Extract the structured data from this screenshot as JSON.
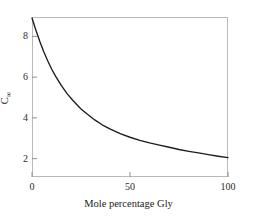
{
  "figure": {
    "background_color": "#ffffff",
    "frame_color": "#b9b9b9",
    "curve_color": "#1c1c1c",
    "tick_color": "#8f8f8f"
  },
  "axes": {
    "y_title_base": "C",
    "y_title_sub": "∞",
    "x_title": "Mole percentage Gly",
    "y_ticks": [
      "2",
      "4",
      "6",
      "8"
    ],
    "x_ticks": [
      "0",
      "50",
      "100"
    ]
  },
  "chart_data": {
    "type": "line",
    "title": "",
    "subtitle": "",
    "xlabel": "Mole percentage Gly",
    "ylabel": "C∞",
    "xlim": [
      0,
      100
    ],
    "ylim": [
      1.1,
      8.95
    ],
    "xticks": [
      0,
      50,
      100
    ],
    "yticks": [
      2,
      4,
      6,
      8
    ],
    "grid": false,
    "legend": null,
    "series": [
      {
        "name": "C-infinity vs mole percentage Gly",
        "color": "#1c1c1c",
        "x": [
          0,
          2,
          4,
          6,
          8,
          10,
          12,
          15,
          18,
          21,
          25,
          28,
          32,
          36,
          40,
          45,
          50,
          55,
          60,
          65,
          70,
          75,
          80,
          85,
          90,
          95,
          100
        ],
        "y": [
          8.9,
          8.3,
          7.75,
          7.25,
          6.8,
          6.4,
          6.05,
          5.58,
          5.18,
          4.84,
          4.44,
          4.2,
          3.9,
          3.65,
          3.45,
          3.23,
          3.05,
          2.9,
          2.77,
          2.66,
          2.56,
          2.45,
          2.36,
          2.28,
          2.2,
          2.12,
          2.05
        ]
      }
    ],
    "annotations": []
  }
}
